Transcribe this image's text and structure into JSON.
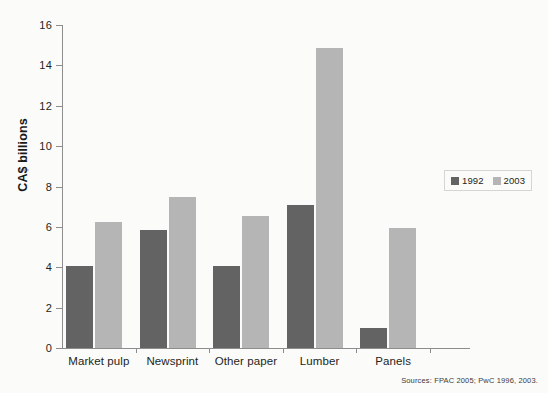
{
  "chart_data": {
    "type": "bar",
    "title": "",
    "subtitle": "",
    "xlabel": "",
    "ylabel": "CA$ billions",
    "categories": [
      "Market pulp",
      "Newsprint",
      "Other paper",
      "Lumber",
      "Panels"
    ],
    "series": [
      {
        "name": "1992",
        "color": "#636363",
        "values": [
          4.05,
          5.85,
          4.05,
          7.1,
          1.0
        ]
      },
      {
        "name": "2003",
        "color": "#b5b5b5",
        "values": [
          6.25,
          7.5,
          6.55,
          14.85,
          5.95
        ]
      }
    ],
    "ylim": [
      0,
      16
    ],
    "yticks": [
      0,
      2,
      4,
      6,
      8,
      10,
      12,
      14,
      16
    ],
    "ytick_labels": [
      "0",
      "2",
      "4",
      "6",
      "8",
      "10",
      "12",
      "14",
      "16"
    ],
    "grid": false,
    "legend_position": "right",
    "legend_entries": [
      "1992",
      "2003"
    ]
  },
  "legend": {
    "items": [
      {
        "label": "1992",
        "swatch": "legend-swatch-1992"
      },
      {
        "label": "2003",
        "swatch": "legend-swatch-2003"
      }
    ]
  },
  "footer": {
    "source": "Sources: FPAC 2005; PwC 1996, 2003."
  },
  "colors": {
    "series_1992": "#636363",
    "series_2003": "#b5b5b5",
    "axis": "#8d8d8d",
    "background": "#fbfbfa",
    "text": "#231f20"
  }
}
